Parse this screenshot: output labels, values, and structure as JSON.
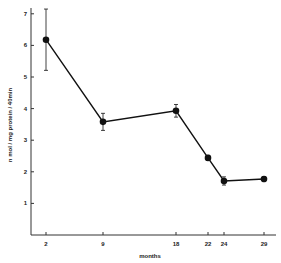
{
  "chart_data": {
    "type": "line",
    "title": "",
    "xlabel": "months",
    "ylabel": "n mol / mg protein / 40min",
    "x": [
      2,
      9,
      18,
      22,
      24,
      29
    ],
    "series": [
      {
        "name": "activity",
        "values": [
          6.18,
          3.58,
          3.93,
          2.44,
          1.71,
          1.77
        ],
        "error": [
          0.97,
          0.27,
          0.2,
          0.08,
          0.13,
          0.08
        ]
      }
    ],
    "x_ticks": [
      2,
      9,
      18,
      22,
      24,
      29
    ],
    "y_ticks": [
      1,
      2,
      3,
      4,
      5,
      6,
      7
    ],
    "ylim": [
      0,
      7.3
    ],
    "grid": false,
    "legend": "none",
    "colors": {
      "line": "#111111",
      "marker": "#111111",
      "axis": "#333333"
    }
  }
}
